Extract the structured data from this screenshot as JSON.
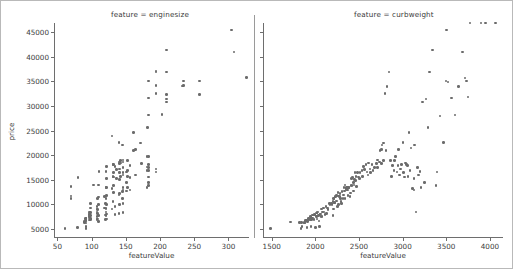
{
  "figure": {
    "width": 513,
    "height": 269,
    "background": "#ffffff",
    "frame_color": "#b9b9b9",
    "marker_color": "#6b6b6b",
    "axis_color": "#6e6e6e",
    "text_color": "#3c3c3c",
    "ylabel": "price"
  },
  "chart_data": [
    {
      "type": "scatter",
      "title": "feature = enginesize",
      "xlabel": "featureValue",
      "ylabel": "price",
      "xlim": [
        45,
        330
      ],
      "ylim": [
        3200,
        46800
      ],
      "xticks": [
        50,
        100,
        150,
        200,
        250,
        300
      ],
      "yticks": [
        5000,
        10000,
        15000,
        20000,
        25000,
        30000,
        35000,
        40000,
        45000
      ],
      "grid": false,
      "legend": "none",
      "marker_color": "#6b6b6b",
      "x": [
        61,
        70,
        70,
        70,
        79,
        80,
        90,
        90,
        91,
        91,
        92,
        92,
        92,
        92,
        92,
        92,
        97,
        97,
        97,
        97,
        97,
        97,
        97,
        98,
        98,
        98,
        98,
        98,
        98,
        103,
        108,
        108,
        108,
        108,
        108,
        109,
        109,
        109,
        109,
        110,
        110,
        110,
        110,
        110,
        111,
        119,
        119,
        120,
        120,
        120,
        121,
        121,
        121,
        121,
        121,
        121,
        122,
        122,
        122,
        122,
        122,
        122,
        122,
        130,
        130,
        130,
        131,
        131,
        131,
        132,
        132,
        132,
        132,
        132,
        134,
        134,
        134,
        136,
        136,
        140,
        140,
        140,
        141,
        141,
        141,
        141,
        141,
        141,
        141,
        142,
        142,
        143,
        145,
        145,
        145,
        146,
        146,
        146,
        146,
        146,
        146,
        146,
        146,
        146,
        151,
        151,
        151,
        152,
        152,
        152,
        152,
        156,
        156,
        156,
        161,
        161,
        164,
        164,
        171,
        173,
        181,
        181,
        181,
        181,
        182,
        183,
        183,
        183,
        183,
        183,
        183,
        183,
        183,
        183,
        183,
        194,
        194,
        194,
        194,
        194,
        194,
        203,
        209,
        209,
        209,
        209,
        209,
        233,
        234,
        234,
        258,
        258,
        304,
        308,
        326
      ],
      "y": [
        5151,
        11248,
        11694,
        13645,
        5389,
        15510,
        6295,
        6575,
        6692,
        7099,
        5118,
        5572,
        6229,
        6692,
        7129,
        7295,
        6855,
        7295,
        7609,
        7898,
        8013,
        8238,
        8449,
        6938,
        7198,
        7775,
        8358,
        9258,
        10198,
        13950,
        6989,
        7609,
        8495,
        9095,
        9538,
        7053,
        8189,
        8948,
        11199,
        6488,
        7799,
        9960,
        11549,
        13950,
        16630,
        9279,
        11595,
        6918,
        7895,
        10245,
        7775,
        8495,
        9233,
        11248,
        13499,
        16695,
        7053,
        8058,
        9989,
        11850,
        13415,
        15250,
        17669,
        9095,
        13200,
        23875,
        10595,
        15645,
        18150,
        12440,
        13860,
        15580,
        16430,
        18150,
        7957,
        9549,
        17710,
        15250,
        17075,
        8189,
        11900,
        22625,
        9959,
        12170,
        15040,
        16503,
        17199,
        18280,
        18620,
        15690,
        18950,
        18399,
        11259,
        12629,
        22018,
        8358,
        10198,
        12945,
        13499,
        15998,
        16515,
        17450,
        18620,
        19045,
        12764,
        14399,
        16558,
        13415,
        15645,
        16900,
        18885,
        12940,
        15510,
        17950,
        20970,
        24565,
        15998,
        21105,
        22470,
        18344,
        13415,
        16845,
        17580,
        19699,
        25552,
        13845,
        14489,
        15580,
        16900,
        17450,
        18150,
        19699,
        28176,
        31600,
        35056,
        16558,
        17199,
        32528,
        34184,
        36880,
        37028,
        28248,
        30760,
        31400,
        32250,
        36880,
        41315,
        34028,
        34184,
        35056,
        32250,
        35056,
        45400,
        40960,
        35800
      ]
    },
    {
      "type": "scatter",
      "title": "feature = curbweight",
      "xlabel": "featureValue",
      "ylabel": "price",
      "xlim": [
        1400,
        4150
      ],
      "ylim": [
        3200,
        46800
      ],
      "xticks": [
        1500,
        2000,
        2500,
        3000,
        3500,
        4000
      ],
      "yticks": [
        5000,
        10000,
        15000,
        20000,
        25000,
        30000,
        35000,
        40000,
        45000
      ],
      "grid": false,
      "legend": "none",
      "marker_color": "#6b6b6b",
      "x": [
        1488,
        1713,
        1819,
        1837,
        1840,
        1845,
        1874,
        1876,
        1890,
        1900,
        1905,
        1909,
        1918,
        1918,
        1944,
        1944,
        1945,
        1950,
        1951,
        1956,
        1967,
        1970,
        1985,
        1989,
        1993,
        2004,
        2010,
        2015,
        2017,
        2019,
        2028,
        2037,
        2040,
        2050,
        2052,
        2060,
        2064,
        2070,
        2075,
        2081,
        2094,
        2100,
        2109,
        2120,
        2128,
        2140,
        2145,
        2161,
        2169,
        2182,
        2190,
        2200,
        2204,
        2206,
        2209,
        2212,
        2218,
        2221,
        2227,
        2231,
        2240,
        2244,
        2254,
        2260,
        2264,
        2265,
        2275,
        2280,
        2289,
        2293,
        2300,
        2304,
        2319,
        2325,
        2328,
        2335,
        2340,
        2341,
        2349,
        2350,
        2354,
        2365,
        2370,
        2372,
        2379,
        2385,
        2395,
        2403,
        2410,
        2414,
        2420,
        2425,
        2434,
        2440,
        2443,
        2450,
        2455,
        2460,
        2465,
        2472,
        2480,
        2495,
        2504,
        2510,
        2535,
        2540,
        2551,
        2563,
        2579,
        2590,
        2604,
        2612,
        2626,
        2635,
        2650,
        2661,
        2679,
        2700,
        2710,
        2714,
        2734,
        2740,
        2755,
        2758,
        2765,
        2778,
        2780,
        2800,
        2811,
        2822,
        2844,
        2860,
        2870,
        2885,
        2900,
        2910,
        2921,
        2935,
        2945,
        2952,
        2965,
        2976,
        2990,
        3005,
        3012,
        3020,
        3034,
        3045,
        3053,
        3060,
        3075,
        3086,
        3095,
        3110,
        3130,
        3131,
        3139,
        3151,
        3170,
        3180,
        3197,
        3210,
        3230,
        3250,
        3270,
        3291,
        3310,
        3340,
        3380,
        3395,
        3430,
        3465,
        3495,
        3505,
        3520,
        3560,
        3600,
        3640,
        3685,
        3715,
        3730,
        3750,
        3770,
        3900,
        3950,
        4066
      ],
      "y": [
        5151,
        6479,
        6295,
        5118,
        6338,
        5572,
        6229,
        6377,
        6692,
        6795,
        5389,
        6488,
        6855,
        7129,
        6938,
        7609,
        7198,
        5572,
        7295,
        6989,
        7898,
        7295,
        6918,
        7895,
        8013,
        5348,
        8238,
        7609,
        8358,
        7053,
        8449,
        7775,
        6649,
        5572,
        7999,
        8058,
        7609,
        9095,
        7609,
        8449,
        9258,
        8495,
        7999,
        9538,
        8189,
        9279,
        8948,
        10198,
        9959,
        10245,
        9989,
        7775,
        10595,
        11199,
        9095,
        11248,
        10295,
        10345,
        11549,
        11595,
        11850,
        10698,
        9549,
        12440,
        11694,
        9989,
        11595,
        12170,
        11245,
        10595,
        10198,
        12629,
        11199,
        11900,
        13415,
        12764,
        13950,
        11259,
        13200,
        12945,
        13495,
        13415,
        12940,
        11850,
        13499,
        13499,
        11595,
        12290,
        13845,
        15250,
        13860,
        15510,
        12764,
        14399,
        13950,
        15040,
        16500,
        14869,
        15645,
        13645,
        16430,
        15580,
        15250,
        16503,
        16900,
        15690,
        17710,
        17075,
        18150,
        16558,
        15998,
        18399,
        17199,
        16515,
        18150,
        16845,
        17450,
        18280,
        19045,
        17450,
        18620,
        20970,
        18344,
        21105,
        22018,
        18950,
        22470,
        32528,
        20970,
        33900,
        36880,
        18920,
        15690,
        17950,
        16900,
        18885,
        19699,
        16558,
        17950,
        21105,
        15998,
        17199,
        18150,
        22625,
        16430,
        15580,
        18420,
        18150,
        17950,
        15690,
        24565,
        16900,
        21485,
        13200,
        12945,
        15250,
        22018,
        8449,
        17450,
        15998,
        16630,
        13499,
        30760,
        14489,
        31400,
        25552,
        36880,
        41315,
        13845,
        16558,
        27900,
        22625,
        35056,
        45400,
        34800,
        31600,
        28176,
        33900,
        40960,
        35656,
        35056,
        31800
      ]
    }
  ]
}
